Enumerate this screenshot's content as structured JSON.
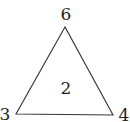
{
  "diagram": {
    "shape": "triangle",
    "stroke_color": "#333333",
    "labels": {
      "top": "6",
      "center": "2",
      "bottom_left": "3",
      "bottom_right": "4"
    }
  }
}
